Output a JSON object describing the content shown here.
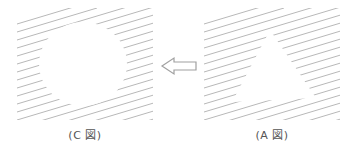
{
  "figure": {
    "left_panel": {
      "label": "(C 図)",
      "void_shape": "circle"
    },
    "right_panel": {
      "label": "(A 図)",
      "void_shape": "triangle"
    },
    "arrow": {
      "direction": "left",
      "style": "hollow",
      "icon": "arrow-left-outline-icon"
    }
  },
  "colors": {
    "hatch": "#b8b8b8",
    "arrow": "#a0a0a0",
    "label": "#555555",
    "background": "#ffffff"
  }
}
